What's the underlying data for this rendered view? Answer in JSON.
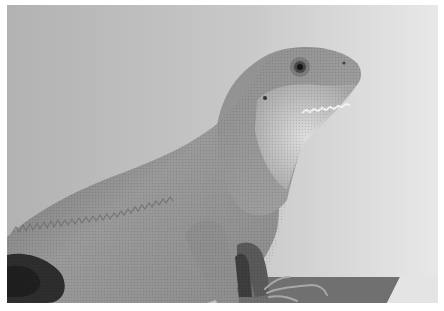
{
  "image": {
    "subject": "lizard",
    "description": "Grayscale side-profile photograph of a water dragon lizard perched on a ledge, head raised facing right, against a light gray background",
    "palette": {
      "background_left": "#b4b4b4",
      "background_right": "#e6e6e6",
      "body_mid": "#8a8a8a",
      "body_dark": "#3a3a3a",
      "throat_light": "#d0d0d0",
      "ledge": "#6e6e6e",
      "border": "#ffffff"
    }
  }
}
